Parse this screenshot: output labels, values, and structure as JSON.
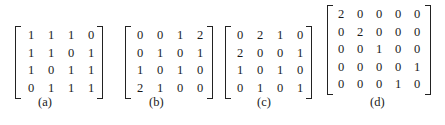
{
  "figures": [
    {
      "caption": "(a)",
      "rows": [
        [
          "1",
          "1",
          "1",
          "0"
        ],
        [
          "1",
          "1",
          "0",
          "1"
        ],
        [
          "1",
          "0",
          "1",
          "1"
        ],
        [
          "0",
          "1",
          "1",
          "1"
        ]
      ]
    },
    {
      "caption": "(b)",
      "rows": [
        [
          "0",
          "0",
          "1",
          "2"
        ],
        [
          "0",
          "1",
          "0",
          "1"
        ],
        [
          "1",
          "0",
          "1",
          "0"
        ],
        [
          "2",
          "1",
          "0",
          "0"
        ]
      ]
    },
    {
      "caption": "(c)",
      "rows": [
        [
          "0",
          "2",
          "1",
          "0"
        ],
        [
          "2",
          "0",
          "0",
          "1"
        ],
        [
          "1",
          "0",
          "1",
          "0"
        ],
        [
          "0",
          "1",
          "0",
          "1"
        ]
      ]
    },
    {
      "caption": "(d)",
      "rows": [
        [
          "2",
          "0",
          "0",
          "0",
          "0"
        ],
        [
          "0",
          "2",
          "0",
          "0",
          "0"
        ],
        [
          "0",
          "0",
          "1",
          "0",
          "0"
        ],
        [
          "0",
          "0",
          "0",
          "0",
          "1"
        ],
        [
          "0",
          "0",
          "0",
          "1",
          "0"
        ]
      ]
    }
  ]
}
